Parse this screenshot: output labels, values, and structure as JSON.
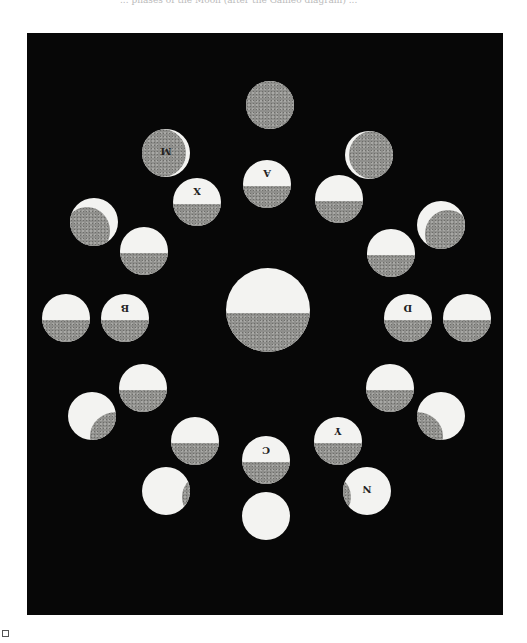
{
  "caption": "... phases of the Moon (after the Galileo diagram) ...",
  "figure": {
    "background": "#070707",
    "light_color": "#f3f3f1",
    "shadow_color": "#8f8f8c",
    "central_body": {
      "cx": 268,
      "cy": 310,
      "r": 42
    },
    "labels": {
      "A": "A",
      "X": "X",
      "M": "M",
      "B": "B",
      "C": "C",
      "D": "D",
      "Y": "Y",
      "N": "N"
    },
    "inner_ring": [
      {
        "id": "A",
        "cx": 267,
        "cy": 184,
        "r": 24,
        "dark_frac": 0.45,
        "label": "A"
      },
      {
        "id": "top-right",
        "cx": 339,
        "cy": 199,
        "r": 24,
        "dark_frac": 0.45,
        "label": ""
      },
      {
        "id": "X",
        "cx": 197,
        "cy": 202,
        "r": 24,
        "dark_frac": 0.45,
        "label": "X"
      },
      {
        "id": "left-upper",
        "cx": 144,
        "cy": 251,
        "r": 24,
        "dark_frac": 0.45,
        "label": ""
      },
      {
        "id": "right-upper",
        "cx": 391,
        "cy": 253,
        "r": 24,
        "dark_frac": 0.45,
        "label": ""
      },
      {
        "id": "B",
        "cx": 125,
        "cy": 318,
        "r": 24,
        "dark_frac": 0.45,
        "label": "B"
      },
      {
        "id": "D",
        "cx": 408,
        "cy": 318,
        "r": 24,
        "dark_frac": 0.45,
        "label": "D"
      },
      {
        "id": "left-lower",
        "cx": 143,
        "cy": 388,
        "r": 24,
        "dark_frac": 0.45,
        "label": ""
      },
      {
        "id": "right-lower",
        "cx": 390,
        "cy": 388,
        "r": 24,
        "dark_frac": 0.45,
        "label": ""
      },
      {
        "id": "bottom-left",
        "cx": 195,
        "cy": 441,
        "r": 24,
        "dark_frac": 0.45,
        "label": ""
      },
      {
        "id": "Y",
        "cx": 338,
        "cy": 441,
        "r": 24,
        "dark_frac": 0.45,
        "label": "Y"
      },
      {
        "id": "C",
        "cx": 266,
        "cy": 460,
        "r": 24,
        "dark_frac": 0.45,
        "label": "C"
      }
    ],
    "outer_ring": [
      {
        "id": "top",
        "cx": 270,
        "cy": 105,
        "r": 24,
        "phase": "new",
        "label": ""
      },
      {
        "id": "M",
        "cx": 166,
        "cy": 153,
        "r": 24,
        "phase": "thin-crescent-right",
        "label": "M"
      },
      {
        "id": "top-right-outer",
        "cx": 369,
        "cy": 155,
        "r": 24,
        "phase": "thin-crescent-left",
        "label": ""
      },
      {
        "id": "upper-left-outer",
        "cx": 94,
        "cy": 222,
        "r": 24,
        "phase": "crescent-top-right",
        "label": ""
      },
      {
        "id": "upper-right-outer",
        "cx": 441,
        "cy": 225,
        "r": 24,
        "phase": "crescent-top-left",
        "label": ""
      },
      {
        "id": "left-outer",
        "cx": 66,
        "cy": 318,
        "r": 24,
        "phase": "half",
        "label": ""
      },
      {
        "id": "right-outer",
        "cx": 467,
        "cy": 318,
        "r": 24,
        "phase": "half",
        "label": ""
      },
      {
        "id": "lower-left-outer",
        "cx": 92,
        "cy": 416,
        "r": 24,
        "phase": "gibbous-right",
        "label": ""
      },
      {
        "id": "lower-right-outer",
        "cx": 441,
        "cy": 416,
        "r": 24,
        "phase": "gibbous-left",
        "label": ""
      },
      {
        "id": "bottom-left-outer",
        "cx": 166,
        "cy": 491,
        "r": 24,
        "phase": "nearly-full-right",
        "label": ""
      },
      {
        "id": "N",
        "cx": 367,
        "cy": 491,
        "r": 24,
        "phase": "nearly-full-left",
        "label": "N"
      },
      {
        "id": "bottom",
        "cx": 266,
        "cy": 516,
        "r": 24,
        "phase": "full",
        "label": ""
      }
    ]
  }
}
